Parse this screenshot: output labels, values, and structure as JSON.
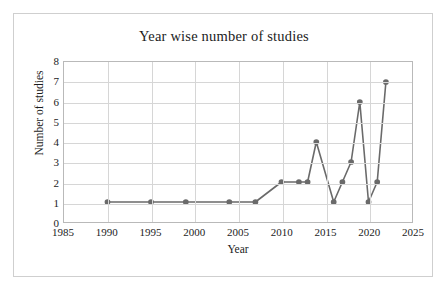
{
  "chart_data": {
    "type": "line",
    "title": "Year wise number of studies",
    "xlabel": "Year",
    "ylabel": "Number of studies",
    "x": [
      1990,
      1995,
      1999,
      2004,
      2007,
      2010,
      2012,
      2013,
      2014,
      2016,
      2017,
      2018,
      2019,
      2020,
      2021,
      2022
    ],
    "values": [
      1,
      1,
      1,
      1,
      1,
      2,
      2,
      2,
      4,
      1,
      2,
      3,
      6,
      1,
      2,
      7
    ],
    "series": [
      {
        "name": "Number of studies",
        "values": [
          1,
          1,
          1,
          1,
          1,
          2,
          2,
          2,
          4,
          1,
          2,
          3,
          6,
          1,
          2,
          7
        ]
      }
    ],
    "xlim": [
      1985,
      2025
    ],
    "ylim": [
      0,
      8
    ],
    "xticks": [
      1985,
      1990,
      1995,
      2000,
      2005,
      2010,
      2015,
      2020,
      2025
    ],
    "yticks": [
      0,
      1,
      2,
      3,
      4,
      5,
      6,
      7,
      8
    ],
    "grid": true,
    "legend": false,
    "marker": "circle",
    "line_color": "#6a6a6a",
    "marker_color": "#6a6a6a",
    "grid_color": "#d6d6d6",
    "plot_border_color": "#b9b9b9",
    "frame_color": "#cfcfcf",
    "background_color": "#ffffff",
    "text_color": "#1c1c1c"
  }
}
